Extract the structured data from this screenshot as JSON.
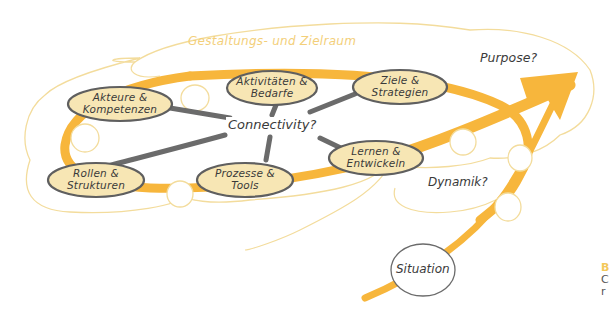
{
  "diagram": {
    "zone_title": "Gestaltungs- und Zielraum",
    "center_label": "Connectivity?",
    "purpose_label": "Purpose?",
    "dynamik_label": "Dynamik?",
    "situation_label": "Situation",
    "nodes": [
      {
        "id": "akteure",
        "line1": "Akteure &",
        "line2": "Kompetenzen"
      },
      {
        "id": "aktivitaeten",
        "line1": "Aktivitäten &",
        "line2": "Bedarfe"
      },
      {
        "id": "ziele",
        "line1": "Ziele &",
        "line2": "Strategien"
      },
      {
        "id": "lernen",
        "line1": "Lernen &",
        "line2": "Entwickeln"
      },
      {
        "id": "prozesse",
        "line1": "Prozesse &",
        "line2": "Tools"
      },
      {
        "id": "rollen",
        "line1": "Rollen &",
        "line2": "Strukturen"
      }
    ],
    "caption_fragment": {
      "line1": "B",
      "line2": "C",
      "line3": "r"
    }
  },
  "colors": {
    "orange_path": "#f7b63c",
    "cloud_outline": "#f3dc9c",
    "node_fill": "#f7e6b4",
    "node_border": "#5f5f5f",
    "connector_gray": "#6b6b6b",
    "text_dark": "#3a3a3a",
    "zone_title": "#f3cf7a",
    "caption_accent": "#f3c85a"
  }
}
